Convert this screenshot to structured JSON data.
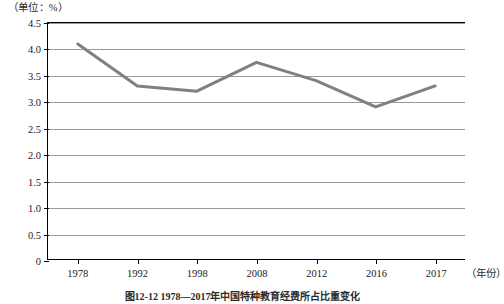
{
  "unit_label": "（单位：%）",
  "x_axis_unit": "（年份）",
  "caption": "图12-12  1978—2017年中国特种教育经费所占比重变化",
  "colors": {
    "line": "#808080",
    "grid": "#9a9a9a",
    "axis": "#000000",
    "text": "#1a1a1a",
    "background": "#ffffff"
  },
  "chart_data": {
    "type": "line",
    "title": "",
    "subtitle": "",
    "xlabel": "（年份）",
    "ylabel": "（单位：%）",
    "categories": [
      "1978",
      "1992",
      "1998",
      "2008",
      "2012",
      "2016",
      "2017"
    ],
    "values": [
      4.1,
      3.3,
      3.2,
      3.75,
      3.4,
      2.9,
      3.3
    ],
    "series": [
      {
        "name": "占比",
        "values": [
          4.1,
          3.3,
          3.2,
          3.75,
          3.4,
          2.9,
          3.3
        ]
      }
    ],
    "ylim": [
      0,
      4.5
    ],
    "ytick_labels": [
      "0",
      "0.5",
      "1.0",
      "1.5",
      "2.0",
      "2.5",
      "3.0",
      "3.5",
      "4.0",
      "4.5"
    ],
    "ytick_values": [
      0,
      0.5,
      1.0,
      1.5,
      2.0,
      2.5,
      3.0,
      3.5,
      4.0,
      4.5
    ],
    "xtick_labels": [
      "1978",
      "1992",
      "1998",
      "2008",
      "2012",
      "2016",
      "2017"
    ],
    "grid": "horizontal",
    "legend": "none",
    "line_color": "#808080",
    "line_width": 3,
    "markers": "none"
  }
}
